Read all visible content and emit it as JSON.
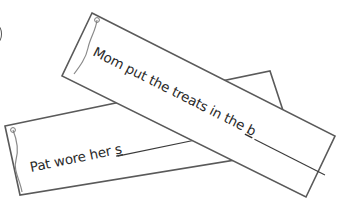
{
  "worksheet": {
    "strips": [
      {
        "id": "back",
        "sentence": "Pat wore her ",
        "letter_hint": "s",
        "blank": true
      },
      {
        "id": "front",
        "sentence": "Mom put the treats in the ",
        "letter_hint": "b",
        "blank": true
      }
    ],
    "colors": {
      "outline": "#5a5a5a",
      "paper": "#ffffff",
      "text": "#2a2a2a",
      "curl": "#8a8a8a"
    }
  }
}
